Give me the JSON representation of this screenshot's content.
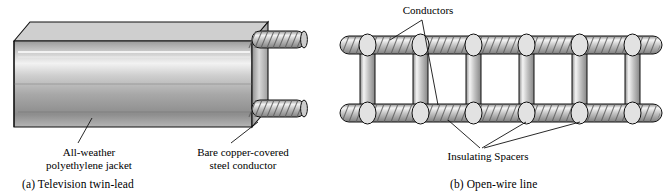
{
  "figure": {
    "panels": [
      {
        "id": "panel-a",
        "caption": "(a) Television twin-lead",
        "labels": [
          {
            "name": "jacket-label",
            "line1": "All-weather",
            "line2": "polyethylene jacket"
          },
          {
            "name": "conductor-label",
            "line1": "Bare copper-covered",
            "line2": "steel conductor"
          }
        ],
        "colors": {
          "jacket_light": "#e9e9e9",
          "jacket_mid": "#b9b9b9",
          "jacket_dark": "#8e8e8e",
          "outline": "#111111",
          "wire_light": "#f0f0f0",
          "wire_mid": "#a9a9a9"
        }
      },
      {
        "id": "panel-b",
        "caption": "(b) Open-wire line",
        "labels": [
          {
            "name": "conductors-label",
            "line1": "Conductors"
          },
          {
            "name": "insulating-spacers-label",
            "line1": "Insulating Spacers"
          }
        ],
        "colors": {
          "wire_light": "#f2f2f2",
          "wire_mid": "#9f9f9f",
          "outline": "#111111",
          "spacer_light": "#ededed",
          "spacer_mid": "#b0b0b0"
        }
      }
    ]
  }
}
